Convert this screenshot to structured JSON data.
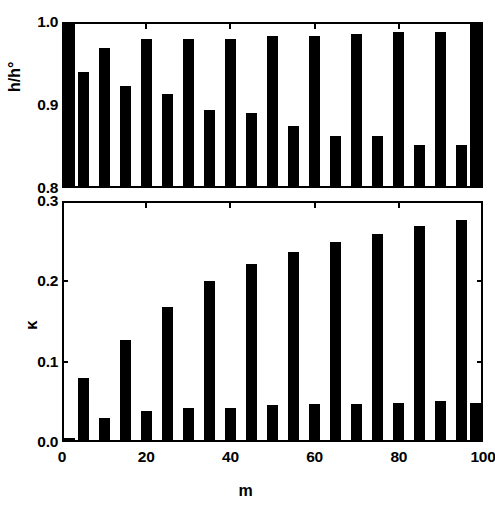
{
  "figure": {
    "background": "#ffffff",
    "bar_color": "#000000",
    "axis_color": "#000000"
  },
  "xaxis": {
    "label": "m",
    "ticks": [
      0,
      20,
      40,
      60,
      80,
      100
    ],
    "tick_labels": [
      "0",
      "20",
      "40",
      "60",
      "80",
      "100"
    ],
    "min": 0,
    "max": 100
  },
  "panels": {
    "top": {
      "ylabel": "h/h°",
      "ytick_labels": [
        "1.0",
        "0.9",
        "0.8"
      ],
      "yticks": [
        1.0,
        0.9,
        0.8
      ],
      "ymin": 0.8,
      "ymax": 1.0
    },
    "bottom": {
      "ylabel": "κ",
      "ytick_labels": [
        "0.3",
        "0.2",
        "0.1",
        "0.0"
      ],
      "yticks": [
        0.3,
        0.2,
        0.1,
        0.0
      ],
      "ymin": 0.0,
      "ymax": 0.3
    }
  },
  "chart_data": [
    {
      "type": "bar",
      "id": "top-panel",
      "title": "",
      "xlabel": "m",
      "ylabel": "h/h°",
      "xlim": [
        0,
        100
      ],
      "ylim": [
        0.8,
        1.0
      ],
      "grid": false,
      "legend": null,
      "categories": [
        0,
        5,
        10,
        15,
        20,
        25,
        30,
        35,
        40,
        45,
        50,
        55,
        60,
        65,
        70,
        75,
        80,
        85,
        90,
        95,
        100
      ],
      "values": [
        1.0,
        0.941,
        0.971,
        0.924,
        0.981,
        0.913,
        0.981,
        0.894,
        0.981,
        0.89,
        0.985,
        0.874,
        0.985,
        0.862,
        0.988,
        0.862,
        0.99,
        0.851,
        0.99,
        0.851,
        1.0
      ]
    },
    {
      "type": "bar",
      "id": "bottom-panel",
      "title": "",
      "xlabel": "m",
      "ylabel": "κ",
      "xlim": [
        0,
        100
      ],
      "ylim": [
        0.0,
        0.3
      ],
      "grid": false,
      "legend": null,
      "categories": [
        0,
        5,
        10,
        15,
        20,
        25,
        30,
        35,
        40,
        45,
        50,
        55,
        60,
        65,
        70,
        75,
        80,
        85,
        90,
        95,
        100
      ],
      "values": [
        0.002,
        0.078,
        0.028,
        0.127,
        0.037,
        0.169,
        0.04,
        0.201,
        0.041,
        0.223,
        0.044,
        0.238,
        0.045,
        0.251,
        0.045,
        0.261,
        0.047,
        0.271,
        0.049,
        0.278,
        0.047
      ]
    }
  ]
}
